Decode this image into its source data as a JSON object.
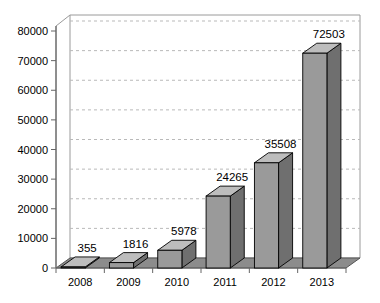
{
  "chart_data": {
    "type": "bar",
    "title": "",
    "xlabel": "",
    "ylabel": "",
    "categories": [
      "2008",
      "2009",
      "2010",
      "2011",
      "2012",
      "2013"
    ],
    "values": [
      355,
      1816,
      5978,
      24265,
      35508,
      72503
    ],
    "data_labels": [
      "355",
      "1816",
      "5978",
      "24265",
      "35508",
      "72503"
    ],
    "ylim": [
      0,
      80000
    ],
    "ytick_labels": [
      "0",
      "10000",
      "20000",
      "30000",
      "40000",
      "50000",
      "60000",
      "70000",
      "80000"
    ],
    "ytick_values": [
      0,
      10000,
      20000,
      30000,
      40000,
      50000,
      60000,
      70000,
      80000
    ],
    "grid": true,
    "grid_style": "dashed",
    "legend": "none",
    "three_d": true,
    "colors": {
      "bar_front": "#9a9a9a",
      "bar_top": "#bdbdbd",
      "bar_side": "#6f6f6f",
      "bar_outline": "#000000",
      "floor": "#8c8c8c",
      "floor_outline": "#555555",
      "wall_outline": "#9a9a9a",
      "axis": "#666666",
      "grid_line": "#b9b9b9",
      "background": "#ffffff",
      "text": "#000000"
    }
  }
}
